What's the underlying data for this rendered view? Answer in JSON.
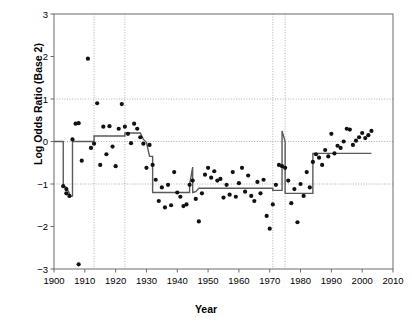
{
  "chart_data": {
    "type": "scatter",
    "title": "",
    "xlabel": "Year",
    "ylabel": "Log Odds Ratio (Base 2)",
    "xlim": [
      1900,
      2010
    ],
    "ylim": [
      -3,
      3
    ],
    "xticks": [
      1900,
      1910,
      1920,
      1930,
      1940,
      1950,
      1960,
      1970,
      1980,
      1990,
      2000,
      2010
    ],
    "yticks": [
      -3,
      -2,
      -1,
      0,
      1,
      2,
      3
    ],
    "grid": "horizontal dotted at y = -1, 0, 1; vertical dotted at changepoints",
    "legend": "none",
    "gridlines_y": [
      -1,
      0,
      1
    ],
    "changepoint_lines_x": [
      1913,
      1923,
      1971,
      1975
    ],
    "series": [
      {
        "name": "Log odds ratio observations",
        "marker": "filled-circle",
        "color": "#000000",
        "points": [
          [
            1903,
            -1.05
          ],
          [
            1904,
            -1.12
          ],
          [
            1904,
            -1.22
          ],
          [
            1905,
            -1.28
          ],
          [
            1906,
            0.05
          ],
          [
            1907,
            0.42
          ],
          [
            1908,
            0.43
          ],
          [
            1908,
            -2.89
          ],
          [
            1909,
            -0.45
          ],
          [
            1911,
            1.95
          ],
          [
            1912,
            -0.15
          ],
          [
            1913,
            -0.05
          ],
          [
            1914,
            0.9
          ],
          [
            1915,
            -0.55
          ],
          [
            1916,
            0.35
          ],
          [
            1917,
            -0.3
          ],
          [
            1918,
            0.36
          ],
          [
            1919,
            -0.12
          ],
          [
            1920,
            -0.58
          ],
          [
            1921,
            0.3
          ],
          [
            1922,
            0.88
          ],
          [
            1923,
            0.35
          ],
          [
            1924,
            0.18
          ],
          [
            1925,
            -0.04
          ],
          [
            1926,
            0.42
          ],
          [
            1927,
            0.3
          ],
          [
            1928,
            0.1
          ],
          [
            1929,
            -0.05
          ],
          [
            1930,
            -0.62
          ],
          [
            1931,
            -0.08
          ],
          [
            1932,
            -0.55
          ],
          [
            1933,
            -0.9
          ],
          [
            1934,
            -1.4
          ],
          [
            1935,
            -1.08
          ],
          [
            1936,
            -1.55
          ],
          [
            1937,
            -1.02
          ],
          [
            1938,
            -1.5
          ],
          [
            1939,
            -0.72
          ],
          [
            1940,
            -1.2
          ],
          [
            1941,
            -1.3
          ],
          [
            1942,
            -1.52
          ],
          [
            1943,
            -1.48
          ],
          [
            1944,
            -1.02
          ],
          [
            1945,
            -0.92
          ],
          [
            1946,
            -1.35
          ],
          [
            1947,
            -1.88
          ],
          [
            1948,
            -1.22
          ],
          [
            1949,
            -0.78
          ],
          [
            1950,
            -0.62
          ],
          [
            1951,
            -0.85
          ],
          [
            1952,
            -0.7
          ],
          [
            1953,
            -0.92
          ],
          [
            1954,
            -0.88
          ],
          [
            1955,
            -1.32
          ],
          [
            1956,
            -1.02
          ],
          [
            1957,
            -1.25
          ],
          [
            1958,
            -0.72
          ],
          [
            1959,
            -1.3
          ],
          [
            1960,
            -0.98
          ],
          [
            1961,
            -0.62
          ],
          [
            1962,
            -1.18
          ],
          [
            1963,
            -0.8
          ],
          [
            1964,
            -1.28
          ],
          [
            1965,
            -1.4
          ],
          [
            1966,
            -0.95
          ],
          [
            1967,
            -1.22
          ],
          [
            1968,
            -0.9
          ],
          [
            1969,
            -1.75
          ],
          [
            1970,
            -2.05
          ],
          [
            1971,
            -1.48
          ],
          [
            1972,
            -1.02
          ],
          [
            1973,
            -0.55
          ],
          [
            1974,
            -0.58
          ],
          [
            1975,
            -0.62
          ],
          [
            1976,
            -0.92
          ],
          [
            1977,
            -1.45
          ],
          [
            1978,
            -1.12
          ],
          [
            1979,
            -1.9
          ],
          [
            1980,
            -1.0
          ],
          [
            1981,
            -1.28
          ],
          [
            1982,
            -0.72
          ],
          [
            1983,
            -1.08
          ],
          [
            1984,
            -0.48
          ],
          [
            1985,
            -0.3
          ],
          [
            1986,
            -0.38
          ],
          [
            1987,
            -0.55
          ],
          [
            1988,
            -0.2
          ],
          [
            1989,
            -0.35
          ],
          [
            1990,
            0.18
          ],
          [
            1991,
            -0.28
          ],
          [
            1992,
            -0.1
          ],
          [
            1993,
            -0.15
          ],
          [
            1994,
            0.0
          ],
          [
            1995,
            0.3
          ],
          [
            1996,
            0.28
          ],
          [
            1997,
            -0.08
          ],
          [
            1998,
            0.02
          ],
          [
            1999,
            0.1
          ],
          [
            2000,
            0.2
          ],
          [
            2001,
            0.08
          ],
          [
            2002,
            0.15
          ],
          [
            2003,
            0.25
          ]
        ]
      },
      {
        "name": "Fitted changepoint step curve",
        "marker": "line",
        "color": "#555555",
        "points": [
          [
            1900,
            0.0
          ],
          [
            1903,
            0.0
          ],
          [
            1903,
            -1.05
          ],
          [
            1904,
            -1.08
          ],
          [
            1905,
            -1.22
          ],
          [
            1905,
            -1.3
          ],
          [
            1906,
            -1.28
          ],
          [
            1906,
            0.0
          ],
          [
            1913,
            0.0
          ],
          [
            1913,
            0.13
          ],
          [
            1923,
            0.13
          ],
          [
            1923,
            0.2
          ],
          [
            1928,
            0.2
          ],
          [
            1929,
            0.05
          ],
          [
            1930,
            -0.02
          ],
          [
            1931,
            -0.35
          ],
          [
            1932,
            -0.35
          ],
          [
            1932,
            -1.2
          ],
          [
            1944,
            -1.2
          ],
          [
            1944,
            -1.02
          ],
          [
            1945,
            -0.6
          ],
          [
            1945,
            -1.2
          ],
          [
            1946,
            -1.18
          ],
          [
            1947,
            -1.1
          ],
          [
            1971,
            -1.1
          ],
          [
            1971,
            -1.15
          ],
          [
            1974,
            -1.15
          ],
          [
            1974,
            0.25
          ],
          [
            1975,
            0.0
          ],
          [
            1975,
            -1.22
          ],
          [
            1984,
            -1.22
          ],
          [
            1984,
            -0.28
          ],
          [
            2003,
            -0.28
          ]
        ]
      }
    ]
  },
  "axes": {
    "x_tick_labels": [
      "1900",
      "1910",
      "1920",
      "1930",
      "1940",
      "1950",
      "1960",
      "1970",
      "1980",
      "1990",
      "2000",
      "2010"
    ],
    "y_tick_labels": [
      "3",
      "2",
      "1",
      "0",
      "−1",
      "−2",
      "−3"
    ],
    "x_axis_title": "Year",
    "y_axis_title": "Log Odds Ratio (Base 2)"
  },
  "colors": {
    "background": "#ffffff",
    "axis": "#6b6b6b",
    "gridline": "#9a9a9a",
    "point": "#111111",
    "fit_line": "#5a5a5a"
  }
}
